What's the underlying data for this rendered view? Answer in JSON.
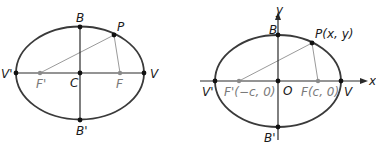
{
  "colors": {
    "ellipse": "#3a3a3a",
    "axis": "#2a2a2a",
    "focal_line": "#9a9a9a",
    "focus_point": "#8a8a8a",
    "point": "#111111",
    "label": "#1a1a1a",
    "focus_label": "#7a7a7a"
  },
  "left_diagram": {
    "labels": {
      "vertex_top": "B",
      "vertex_bottom": "B'",
      "vertex_left": "V'",
      "vertex_right": "V",
      "center": "C",
      "focus_left": "F'",
      "focus_right": "F",
      "point": "P"
    }
  },
  "right_diagram": {
    "labels": {
      "vertex_top": "B",
      "vertex_bottom": "B'",
      "vertex_left": "V'",
      "vertex_right": "V",
      "origin": "O",
      "focus_left": "F'(−c, 0)",
      "focus_right": "F(c, 0)",
      "point": "P(x, y)",
      "x_axis": "x",
      "y_axis": "y"
    }
  }
}
